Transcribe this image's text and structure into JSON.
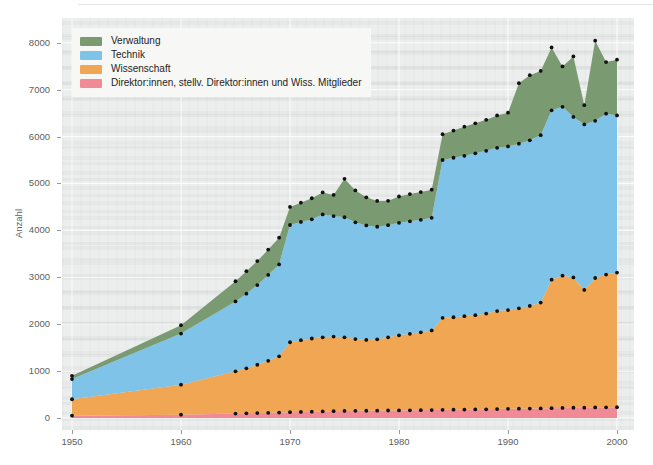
{
  "chart_data": {
    "type": "area",
    "stacked": true,
    "title": "",
    "subtitle": "",
    "xlabel": "",
    "ylabel": "Anzahl",
    "xlim": [
      1950,
      2000
    ],
    "ylim": [
      0,
      8400
    ],
    "yticks": [
      0,
      1000,
      2000,
      3000,
      4000,
      5000,
      6000,
      7000,
      8000
    ],
    "xticks": [
      1950,
      1960,
      1970,
      1980,
      1990,
      2000
    ],
    "xticklabels": [
      "1950",
      "1960",
      "1970",
      "1980",
      "1990",
      "2000"
    ],
    "yticklabels": [
      "0",
      "1000",
      "2000",
      "3000",
      "4000",
      "5000",
      "6000",
      "7000",
      "8000"
    ],
    "grid": true,
    "legend_position": "upper-left",
    "markers": "black dots at each data point on every band boundary",
    "stack_order_bottom_to_top": [
      "Direktor:innen, stellv. Direktor:innen und Wiss. Mitglieder",
      "Wissenschaft",
      "Technik",
      "Verwaltung"
    ],
    "x": [
      1950,
      1960,
      1965,
      1966,
      1967,
      1968,
      1969,
      1970,
      1971,
      1972,
      1973,
      1974,
      1975,
      1976,
      1977,
      1978,
      1979,
      1980,
      1981,
      1982,
      1983,
      1984,
      1985,
      1986,
      1987,
      1988,
      1989,
      1990,
      1991,
      1992,
      1993,
      1994,
      1995,
      1996,
      1997,
      1998,
      1999,
      2000
    ],
    "series": [
      {
        "name": "Direktor:innen, stellv. Direktor:innen und Wiss. Mitglieder",
        "color": "#f08b96",
        "values": [
          50,
          70,
          95,
          100,
          105,
          110,
          115,
          125,
          130,
          135,
          140,
          145,
          150,
          152,
          155,
          157,
          160,
          162,
          164,
          166,
          168,
          175,
          178,
          180,
          183,
          186,
          190,
          195,
          198,
          200,
          205,
          210,
          215,
          218,
          220,
          225,
          228,
          230
        ]
      },
      {
        "name": "Wissenschaft",
        "color": "#f0a653",
        "values": [
          350,
          640,
          900,
          960,
          1030,
          1110,
          1200,
          1490,
          1530,
          1560,
          1580,
          1590,
          1570,
          1530,
          1510,
          1520,
          1560,
          1600,
          1630,
          1660,
          1700,
          1960,
          1970,
          1990,
          2010,
          2040,
          2090,
          2105,
          2140,
          2190,
          2255,
          2740,
          2820,
          2780,
          2510,
          2760,
          2830,
          2870
        ]
      },
      {
        "name": "Technik",
        "color": "#7fc3e8",
        "values": [
          430,
          1090,
          1490,
          1590,
          1700,
          1830,
          1960,
          2500,
          2520,
          2540,
          2620,
          2570,
          2560,
          2490,
          2440,
          2400,
          2390,
          2400,
          2400,
          2400,
          2400,
          3365,
          3400,
          3420,
          3450,
          3470,
          3480,
          3490,
          3510,
          3530,
          3570,
          3610,
          3600,
          3420,
          3530,
          3350,
          3430,
          3350
        ]
      },
      {
        "name": "Verwaltung",
        "color": "#7a9b72",
        "values": [
          70,
          180,
          430,
          480,
          510,
          540,
          570,
          385,
          410,
          450,
          470,
          450,
          820,
          680,
          600,
          550,
          520,
          560,
          580,
          590,
          600,
          550,
          580,
          620,
          640,
          660,
          690,
          720,
          1290,
          1390,
          1370,
          1340,
          860,
          1290,
          410,
          1710,
          1100,
          1190
        ]
      }
    ],
    "totals": [
      900,
      1980,
      2915,
      3130,
      3345,
      3590,
      3845,
      4500,
      4590,
      4685,
      4810,
      4755,
      5100,
      4852,
      4705,
      4627,
      4630,
      4722,
      4774,
      4816,
      4868,
      6050,
      6128,
      6210,
      6283,
      6356,
      6450,
      6510,
      7138,
      7310,
      7400,
      7900,
      7495,
      7708,
      6670,
      8045,
      7588,
      7640
    ]
  },
  "legend": {
    "items": [
      {
        "label": "Verwaltung",
        "color": "#7a9b72"
      },
      {
        "label": "Technik",
        "color": "#7fc3e8"
      },
      {
        "label": "Wissenschaft",
        "color": "#f0a653"
      },
      {
        "label": "Direktor:innen, stellv. Direktor:innen und Wiss. Mitglieder",
        "color": "#f08b96"
      }
    ]
  }
}
